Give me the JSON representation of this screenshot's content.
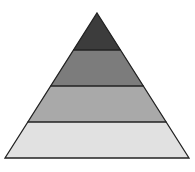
{
  "diagram": {
    "type": "pyramid",
    "levels": [
      {
        "name": "level-1-top",
        "color": "#3c3c3c"
      },
      {
        "name": "level-2",
        "color": "#7c7c7c"
      },
      {
        "name": "level-3",
        "color": "#a9a9a9"
      },
      {
        "name": "level-4-base",
        "color": "#e1e1e1"
      }
    ],
    "outline_color": "#222222"
  }
}
